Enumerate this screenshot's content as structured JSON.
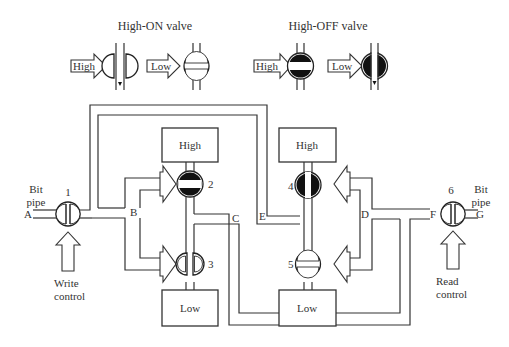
{
  "legend": {
    "high_on_title": "High-ON valve",
    "high_off_title": "High-OFF valve",
    "high_label": "High",
    "low_label": "Low"
  },
  "tanks": {
    "left_high": "High",
    "left_low": "Low",
    "right_high": "High",
    "right_low": "Low"
  },
  "valves": {
    "v1": "1",
    "v2": "2",
    "v3": "3",
    "v4": "4",
    "v5": "5",
    "v6": "6"
  },
  "nodes": {
    "A": "A",
    "B": "B",
    "C": "C",
    "D": "D",
    "E": "E",
    "F": "F",
    "G": "G"
  },
  "labels": {
    "bit_pipe_left_1": "Bit",
    "bit_pipe_left_2": "pipe",
    "bit_pipe_right_1": "Bit",
    "bit_pipe_right_2": "pipe",
    "write_control_1": "Write",
    "write_control_2": "control",
    "read_control_1": "Read",
    "read_control_2": "control"
  },
  "colors": {
    "line": "#333333",
    "fill_dark": "#111111",
    "background": "#ffffff"
  }
}
